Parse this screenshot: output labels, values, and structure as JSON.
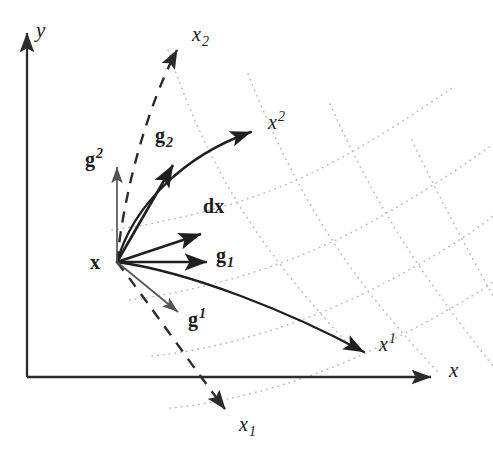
{
  "figure": {
    "width": 493,
    "height": 458,
    "background": "#ffffff"
  },
  "colors": {
    "axis": "#2b2b2b",
    "solid_curve": "#1f1f1f",
    "dashed_curve": "#2b2b2b",
    "grid_dotted": "#b9b9b9",
    "label": "#1a1a1a",
    "thin_vector": "#555555"
  },
  "cartesian_axes": {
    "origin": {
      "x": 27,
      "y": 377
    },
    "y_axis": {
      "label": "y",
      "label_pos": {
        "x": 36,
        "y": 20
      },
      "from": {
        "x": 27,
        "y": 377
      },
      "to": {
        "x": 27,
        "y": 30
      },
      "style": "solid-arrow"
    },
    "x_axis": {
      "label": "x",
      "label_pos": {
        "x": 449,
        "y": 360
      },
      "from": {
        "x": 27,
        "y": 377
      },
      "to": {
        "x": 435,
        "y": 377
      },
      "style": "solid-arrow"
    }
  },
  "curvilinear_axes": [
    {
      "name": "x-superscript-1",
      "label": "x",
      "exponent": "1",
      "label_pos": {
        "x": 379,
        "y": 332
      },
      "style": "solid-curve-arrow",
      "path": "M117,262 C190,272 290,312 368,355",
      "tip": {
        "x": 368,
        "y": 355
      }
    },
    {
      "name": "x-superscript-2",
      "label": "x",
      "exponent": "2",
      "label_pos": {
        "x": 268,
        "y": 110
      },
      "style": "solid-curve-arrow",
      "path": "M117,262 C133,205 185,153 255,130",
      "tip": {
        "x": 255,
        "y": 130
      }
    },
    {
      "name": "x-subscript-1",
      "label": "x",
      "exponent": "1",
      "subscript": true,
      "label_pos": {
        "x": 239,
        "y": 414
      },
      "style": "dashed-arrow",
      "path": "M117,262 C150,305 195,370 227,413",
      "tip": {
        "x": 227,
        "y": 413
      }
    },
    {
      "name": "x-subscript-2",
      "label": "x",
      "exponent": "2",
      "subscript": true,
      "label_pos": {
        "x": 192,
        "y": 24
      },
      "style": "dashed-arrow",
      "path": "M117,262 C124,190 148,105 179,45",
      "tip": {
        "x": 179,
        "y": 45
      }
    }
  ],
  "basis_vectors": [
    {
      "name": "g-sub-1",
      "label": "g",
      "index": "1",
      "index_type": "subscript",
      "kind": "covariant",
      "label_pos": {
        "x": 216,
        "y": 245
      },
      "from": {
        "x": 117,
        "y": 262
      },
      "to": {
        "x": 212,
        "y": 262
      },
      "style": "solid-arrow-thick"
    },
    {
      "name": "g-sub-2",
      "label": "g",
      "index": "2",
      "index_type": "subscript",
      "kind": "covariant",
      "label_pos": {
        "x": 155,
        "y": 125
      },
      "from": {
        "x": 117,
        "y": 262
      },
      "to": {
        "x": 175,
        "y": 160
      },
      "style": "solid-arrow-thick"
    },
    {
      "name": "g-sup-1",
      "label": "g",
      "index": "1",
      "index_type": "superscript",
      "kind": "contravariant",
      "label_pos": {
        "x": 188,
        "y": 307
      },
      "from": {
        "x": 117,
        "y": 262
      },
      "to": {
        "x": 182,
        "y": 316
      },
      "style": "solid-arrow-thin"
    },
    {
      "name": "g-sup-2",
      "label": "g",
      "index": "2",
      "index_type": "superscript",
      "kind": "contravariant",
      "label_pos": {
        "x": 85,
        "y": 147
      },
      "from": {
        "x": 117,
        "y": 262
      },
      "to": {
        "x": 117,
        "y": 163
      },
      "style": "solid-arrow-thin"
    }
  ],
  "differential": {
    "name": "dx",
    "prefix": "d",
    "label": "x",
    "label_pos": {
      "x": 203,
      "y": 196
    },
    "from": {
      "x": 117,
      "y": 262
    },
    "to": {
      "x": 205,
      "y": 232
    },
    "style": "solid-arrow-thick"
  },
  "point": {
    "name": "x",
    "label": "x",
    "label_pos": {
      "x": 90,
      "y": 252
    },
    "position": {
      "x": 117,
      "y": 262
    }
  },
  "grid": {
    "style": "dotted",
    "description": "Curvilinear dotted mesh of constant-coordinate lines",
    "u_lines": [
      "M112,230 C170,222 250,204 318,170 C370,144 420,110 452,88",
      "M130,300 C195,292 285,268 360,228 C418,197 462,166 491,146",
      "M152,356 C215,350 300,326 375,288 C430,260 474,232 493,216",
      "M170,408 C235,402 320,378 392,340 C447,312 486,288 493,282"
    ],
    "v_lines": [
      "M168,50 C188,110 214,168 250,222 C280,268 318,312 352,348",
      "M248,74 C272,134 300,192 336,246 C366,292 404,336 438,372",
      "M330,104 C356,162 386,218 422,270 C452,314 482,352 493,366",
      "M412,140 C438,196 468,250 493,296"
    ]
  }
}
